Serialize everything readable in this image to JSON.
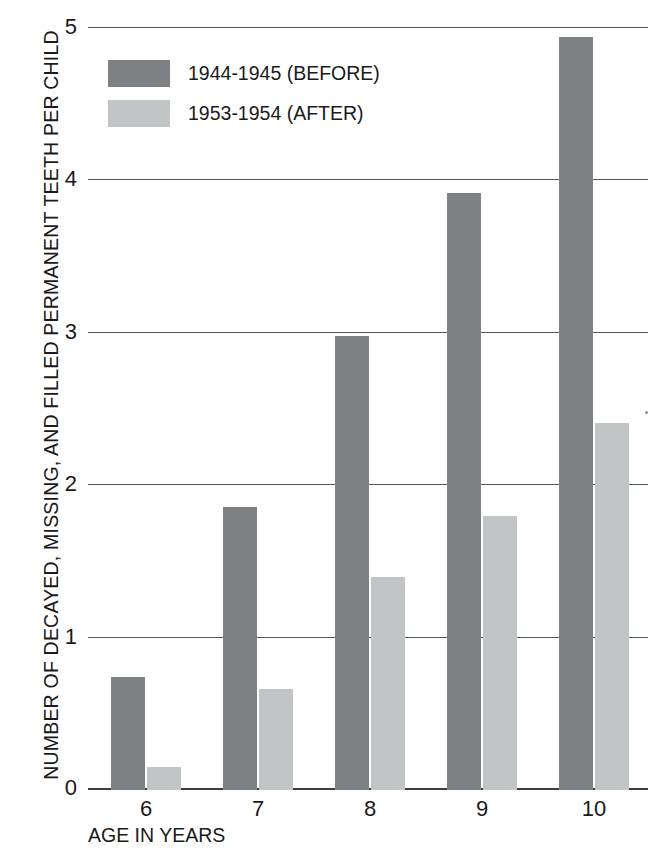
{
  "chart_data": {
    "type": "bar",
    "title": "",
    "subtitle": "",
    "xlabel": "AGE IN YEARS",
    "ylabel": "NUMBER OF DECAYED, MISSING, AND FILLED PERMANENT TEETH PER CHILD",
    "categories": [
      "6",
      "7",
      "8",
      "9",
      "10"
    ],
    "series": [
      {
        "name": "1944-1945 (BEFORE)",
        "color": "#7d8184",
        "values": [
          0.74,
          1.86,
          2.98,
          3.92,
          4.94
        ]
      },
      {
        "name": "1953-1954 (AFTER)",
        "color": "#c2c5c6",
        "values": [
          0.15,
          0.66,
          1.4,
          1.8,
          2.41
        ]
      }
    ],
    "ylim": [
      0,
      5
    ],
    "yticks": [
      "0",
      "1",
      "2",
      "3",
      "4",
      "5"
    ],
    "grid": true,
    "legend_position": "inside-top-left"
  },
  "legend": {
    "items": [
      {
        "label": "1944-1945 (BEFORE)",
        "swatch": "before"
      },
      {
        "label": "1953-1954 (AFTER)",
        "swatch": "after"
      }
    ]
  },
  "colors": {
    "before": "#7d8184",
    "after": "#c2c5c6",
    "axis": "#3a3f42",
    "grid": "#555b5e",
    "background": "#ffffff",
    "text": "#1a1a1a"
  }
}
